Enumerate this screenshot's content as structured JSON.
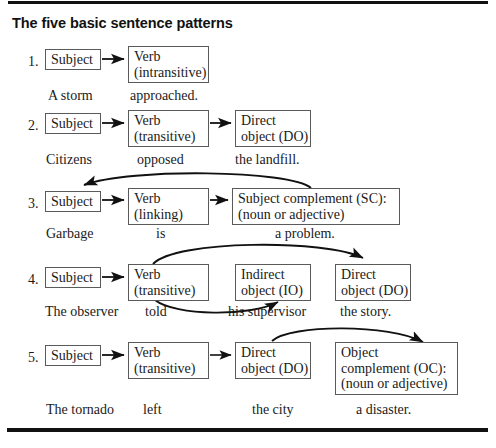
{
  "title": "The five basic sentence patterns",
  "colors": {
    "rule": "#111111",
    "box_border": "#5a5a5a",
    "text": "#1a1a1a",
    "arrow": "#111111",
    "background": "#ffffff"
  },
  "patterns": [
    {
      "number": "1.",
      "nodes": [
        {
          "name": "subject",
          "lines": [
            "Subject"
          ]
        },
        {
          "name": "verb-intransitive",
          "lines": [
            "Verb",
            "(intransitive)"
          ]
        }
      ],
      "example": [
        "A storm",
        "approached."
      ],
      "arrows": [
        "subject-to-verb"
      ]
    },
    {
      "number": "2.",
      "nodes": [
        {
          "name": "subject",
          "lines": [
            "Subject"
          ]
        },
        {
          "name": "verb-transitive",
          "lines": [
            "Verb",
            "(transitive)"
          ]
        },
        {
          "name": "direct-object",
          "lines": [
            "Direct",
            "object (DO)"
          ]
        }
      ],
      "example": [
        "Citizens",
        "opposed",
        "the landfill."
      ],
      "arrows": [
        "subject-to-verb",
        "verb-to-direct-object"
      ]
    },
    {
      "number": "3.",
      "nodes": [
        {
          "name": "subject",
          "lines": [
            "Subject"
          ]
        },
        {
          "name": "verb-linking",
          "lines": [
            "Verb",
            "(linking)"
          ]
        },
        {
          "name": "subject-complement",
          "lines": [
            "Subject complement (SC):",
            "(noun or adjective)"
          ]
        }
      ],
      "example": [
        "Garbage",
        "is",
        "a problem."
      ],
      "arrows": [
        "subject-to-verb",
        "verb-to-subject-complement",
        "subject-complement-back-to-subject"
      ]
    },
    {
      "number": "4.",
      "nodes": [
        {
          "name": "subject",
          "lines": [
            "Subject"
          ]
        },
        {
          "name": "verb-transitive",
          "lines": [
            "Verb",
            "(transitive)"
          ]
        },
        {
          "name": "indirect-object",
          "lines": [
            "Indirect",
            "object (IO)"
          ]
        },
        {
          "name": "direct-object",
          "lines": [
            "Direct",
            "object (DO)"
          ]
        }
      ],
      "example": [
        "The observer",
        "told",
        "his supervisor",
        "the story."
      ],
      "arrows": [
        "subject-to-verb",
        "verb-to-direct-object-over",
        "verb-to-indirect-object-under"
      ]
    },
    {
      "number": "5.",
      "nodes": [
        {
          "name": "subject",
          "lines": [
            "Subject"
          ]
        },
        {
          "name": "verb-transitive",
          "lines": [
            "Verb",
            "(transitive)"
          ]
        },
        {
          "name": "direct-object",
          "lines": [
            "Direct",
            "object (DO)"
          ]
        },
        {
          "name": "object-complement",
          "lines": [
            "Object",
            "complement (OC):",
            "(noun or adjective)"
          ]
        }
      ],
      "example": [
        "The tornado",
        "left",
        "the city",
        "a disaster."
      ],
      "arrows": [
        "subject-to-verb",
        "verb-to-direct-object",
        "direct-object-to-object-complement"
      ]
    }
  ]
}
